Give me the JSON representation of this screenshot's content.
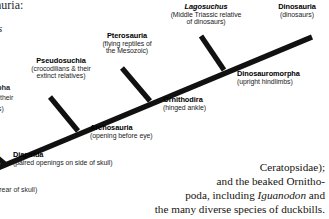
{
  "figure": {
    "type": "cladogram"
  },
  "clades": [
    {
      "id": "diapsida",
      "name": "Diapsida",
      "description": "(paired openings on side of skull)",
      "desc_lines": [
        "(paired openings on side of skull)"
      ]
    },
    {
      "id": "archosauria",
      "name": "Archosauria",
      "description": "(opening before eye)",
      "desc_lines": [
        "(opening before eye)"
      ]
    },
    {
      "id": "pseudosuchia",
      "name": "Pseudosuchia",
      "description": "(crocodilians & their extinct relatives)",
      "desc_lines": [
        "(crocodilians & their",
        "extinct relatives)"
      ]
    },
    {
      "id": "pterosauria",
      "name": "Pterosauria",
      "description": "(flying reptiles of the Mesozoic)",
      "desc_lines": [
        "(flying reptiles of",
        "the Mesozoic)"
      ]
    },
    {
      "id": "ornithodira",
      "name": "Ornithodira",
      "description": "(hinged ankle)",
      "desc_lines": [
        "(hinged ankle)"
      ]
    },
    {
      "id": "lagosuchus",
      "name": "Lagosuchus",
      "italic": true,
      "description": "(Middle Triassic relative of dinosaurs)",
      "desc_lines": [
        "(Middle Triassic relative",
        "of dinosaurs)"
      ]
    },
    {
      "id": "dinosauromorpha",
      "name": "Dinosauromorpha",
      "description": "(upright hindlimbs)",
      "desc_lines": [
        "(upright hindlimbs)"
      ]
    },
    {
      "id": "dinosauria",
      "name": "Dinosauria",
      "description": "(dinosaurs)",
      "desc_lines": [
        "(dinosaurs)"
      ]
    }
  ],
  "cropped_fragments": {
    "top_left_serif": "auria:",
    "left_italic_serif": "s",
    "left_bold": "rpha",
    "left_line2": "their",
    "left_line3": "s)",
    "bottom_left": "in rear of skull)"
  },
  "body_text": {
    "lines": [
      "Ceratopsidae);",
      "and the beaked Ornitho-",
      "poda, including Iguanodon and",
      "the many diverse species of duckbills."
    ],
    "line3_pre": "poda, including ",
    "line3_italic": "Iguanodon",
    "line3_post": " and"
  },
  "colors": {
    "branch": "#111111",
    "text": "#111111",
    "background": "#ffffff"
  }
}
